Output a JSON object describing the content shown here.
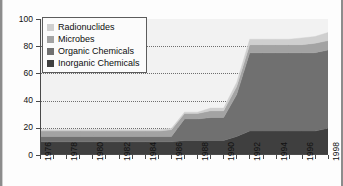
{
  "chart_data": {
    "type": "area",
    "stacked": true,
    "title": "",
    "xlabel": "",
    "ylabel": "",
    "ylim": [
      0,
      100
    ],
    "ytick_values": [
      0,
      20,
      40,
      60,
      80,
      100
    ],
    "ytick_labels": [
      "0",
      "20",
      "40",
      "60",
      "80",
      "100"
    ],
    "grid": true,
    "grid_style": "dotted-horizontal",
    "legend_position": "top-left",
    "x": [
      1976,
      1977,
      1978,
      1979,
      1980,
      1981,
      1982,
      1983,
      1984,
      1985,
      1986,
      1987,
      1988,
      1989,
      1990,
      1991,
      1992,
      1993,
      1994,
      1995,
      1996,
      1997,
      1998
    ],
    "xtick_labels": [
      "1976",
      "1978",
      "1980",
      "1982",
      "1984",
      "1986",
      "1988",
      "1990",
      "1992",
      "1994",
      "1996",
      "1998"
    ],
    "xtick_label_rotation": -90,
    "xtick_interval_years": 2,
    "xlim": [
      1976,
      1998
    ],
    "series": [
      {
        "name": "Inorganic Chemicals",
        "color": "#3f3f3f",
        "values": [
          9,
          9,
          9,
          9,
          9,
          9,
          9,
          9,
          9,
          9,
          9,
          10,
          10,
          10,
          10,
          13,
          17,
          17,
          17,
          17,
          17,
          17,
          19
        ]
      },
      {
        "name": "Organic Chemicals",
        "color": "#707070",
        "values": [
          4,
          4,
          4,
          4,
          4,
          4,
          4,
          4,
          4,
          4,
          4,
          16,
          16,
          17,
          17,
          31,
          58,
          58,
          58,
          58,
          58,
          58,
          58
        ]
      },
      {
        "name": "Microbes",
        "color": "#a3a3a3",
        "values": [
          4,
          4,
          4,
          4,
          4,
          4,
          4,
          4,
          4,
          4,
          5,
          4,
          4,
          5,
          5,
          6,
          6,
          6,
          6,
          6,
          6,
          7,
          7
        ]
      },
      {
        "name": "Radionuclides",
        "color": "#cfcfcf",
        "values": [
          1,
          1,
          1,
          1,
          1,
          1,
          1,
          1,
          1,
          1,
          1,
          1,
          1,
          2,
          2,
          3,
          4,
          4,
          4,
          4,
          5,
          5,
          6
        ]
      }
    ],
    "totals": [
      18,
      18,
      18,
      18,
      18,
      18,
      18,
      18,
      18,
      18,
      19,
      31,
      31,
      34,
      34,
      53,
      85,
      85,
      85,
      85,
      86,
      87,
      90
    ]
  },
  "legend": {
    "items": [
      {
        "label": "Radionuclides",
        "color": "#cfcfcf"
      },
      {
        "label": "Microbes",
        "color": "#a3a3a3"
      },
      {
        "label": "Organic Chemicals",
        "color": "#707070"
      },
      {
        "label": "Inorganic Chemicals",
        "color": "#3f3f3f"
      }
    ]
  },
  "colors": {
    "plot_background": "#f2f2f2",
    "axis": "#4a4a4a",
    "gridline": "#6e6e6e",
    "frame_border": "#8c8c8c"
  }
}
